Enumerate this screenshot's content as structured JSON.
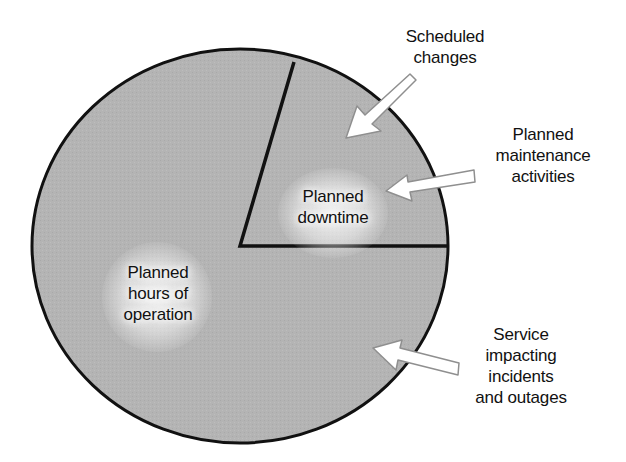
{
  "diagram": {
    "type": "pie-diagram",
    "colors": {
      "slice_fill": "#b5b5b5",
      "outline": "#111111",
      "arrow_fill": "#ffffff",
      "arrow_stroke": "#9a9a9a",
      "background": "#ffffff"
    },
    "slices": [
      {
        "label": "Planned hours of operation",
        "display": "Planned\nhours of\noperation",
        "approx_share_pct": 79.5
      },
      {
        "label": "Planned downtime",
        "display": "Planned\ndowntime",
        "approx_share_pct": 20.5
      }
    ],
    "callouts": [
      {
        "label": "Scheduled changes",
        "display": "Scheduled\nchanges",
        "points_to": "Planned downtime"
      },
      {
        "label": "Planned maintenance activities",
        "display": "Planned\nmaintenance\nactivities",
        "points_to": "Planned downtime"
      },
      {
        "label": "Service impacting incidents and outages",
        "display": "Service\nimpacting\nincidents\nand outages",
        "points_to": "Planned hours of operation"
      }
    ]
  }
}
